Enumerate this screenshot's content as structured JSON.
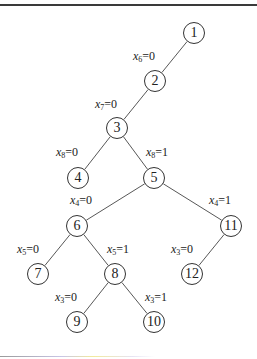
{
  "diagram": {
    "type": "decision-tree",
    "nodes": [
      {
        "id": "1",
        "label": "1",
        "x": 194,
        "y": 33
      },
      {
        "id": "2",
        "label": "2",
        "x": 155,
        "y": 81
      },
      {
        "id": "3",
        "label": "3",
        "x": 117,
        "y": 128
      },
      {
        "id": "4",
        "label": "4",
        "x": 78,
        "y": 178
      },
      {
        "id": "5",
        "label": "5",
        "x": 154,
        "y": 178
      },
      {
        "id": "6",
        "label": "6",
        "x": 77,
        "y": 226
      },
      {
        "id": "11",
        "label": "11",
        "x": 231,
        "y": 226
      },
      {
        "id": "7",
        "label": "7",
        "x": 38,
        "y": 274
      },
      {
        "id": "8",
        "label": "8",
        "x": 115,
        "y": 274
      },
      {
        "id": "12",
        "label": "12",
        "x": 192,
        "y": 274
      },
      {
        "id": "9",
        "label": "9",
        "x": 77,
        "y": 322
      },
      {
        "id": "10",
        "label": "10",
        "x": 154,
        "y": 322
      }
    ],
    "edges": [
      {
        "from": "1",
        "to": "2",
        "var": "x",
        "sub": "6",
        "val": "=0",
        "lx": 133,
        "ly": 50
      },
      {
        "from": "2",
        "to": "3",
        "var": "x",
        "sub": "7",
        "val": "=0",
        "lx": 95,
        "ly": 98
      },
      {
        "from": "3",
        "to": "4",
        "var": "x",
        "sub": "8",
        "val": "=0",
        "lx": 56,
        "ly": 146
      },
      {
        "from": "3",
        "to": "5",
        "var": "x",
        "sub": "8",
        "val": "=1",
        "lx": 146,
        "ly": 146
      },
      {
        "from": "5",
        "to": "6",
        "var": "x",
        "sub": "4",
        "val": "=0",
        "lx": 70,
        "ly": 194
      },
      {
        "from": "5",
        "to": "11",
        "var": "x",
        "sub": "4",
        "val": "=1",
        "lx": 209,
        "ly": 194
      },
      {
        "from": "6",
        "to": "7",
        "var": "x",
        "sub": "5",
        "val": "=0",
        "lx": 17,
        "ly": 243
      },
      {
        "from": "6",
        "to": "8",
        "var": "x",
        "sub": "5",
        "val": "=1",
        "lx": 107,
        "ly": 243
      },
      {
        "from": "11",
        "to": "12",
        "var": "x",
        "sub": "3",
        "val": "=0",
        "lx": 171,
        "ly": 243
      },
      {
        "from": "8",
        "to": "9",
        "var": "x",
        "sub": "3",
        "val": "=0",
        "lx": 55,
        "ly": 291
      },
      {
        "from": "8",
        "to": "10",
        "var": "x",
        "sub": "3",
        "val": "=1",
        "lx": 145,
        "ly": 291
      }
    ],
    "colors": {
      "line": "#444444",
      "text": "#222222",
      "rule": "#3a3a3a"
    }
  }
}
